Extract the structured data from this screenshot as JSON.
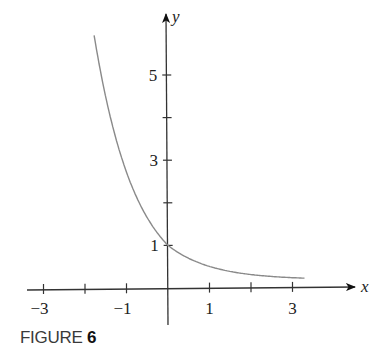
{
  "chart_data": {
    "type": "line",
    "title": "",
    "function": "y = e^(-x)",
    "xlabel": "x",
    "ylabel": "y",
    "xlim": [
      -3.2,
      4.5
    ],
    "ylim": [
      -0.9,
      6.6
    ],
    "grid": false,
    "legend": null,
    "x_ticks": [
      -3,
      -2,
      -1,
      0,
      1,
      2,
      3
    ],
    "x_tick_labels": [
      {
        "value": -3,
        "label": "−3"
      },
      {
        "value": -1,
        "label": "−1"
      },
      {
        "value": 1,
        "label": "1"
      },
      {
        "value": 3,
        "label": "3"
      }
    ],
    "y_ticks": [
      1,
      2,
      3,
      4,
      5
    ],
    "y_tick_labels": [
      {
        "value": 1,
        "label": "1"
      },
      {
        "value": 3,
        "label": "3"
      },
      {
        "value": 5,
        "label": "5"
      }
    ],
    "series": [
      {
        "name": "y = e^(-x)",
        "color": "#8a8a8a",
        "x": [
          -1.78,
          -1.6,
          -1.4,
          -1.2,
          -1.0,
          -0.8,
          -0.6,
          -0.4,
          -0.2,
          0.0,
          0.25,
          0.5,
          0.75,
          1.0,
          1.5,
          2.0,
          2.5,
          3.0,
          3.3
        ],
        "y": [
          5.93,
          4.95,
          4.06,
          3.32,
          2.72,
          2.23,
          1.82,
          1.49,
          1.22,
          1.0,
          0.78,
          0.61,
          0.47,
          0.37,
          0.3,
          0.25,
          0.23,
          0.22,
          0.22
        ]
      }
    ]
  },
  "caption": {
    "label": "FIGURE",
    "number": "6"
  }
}
